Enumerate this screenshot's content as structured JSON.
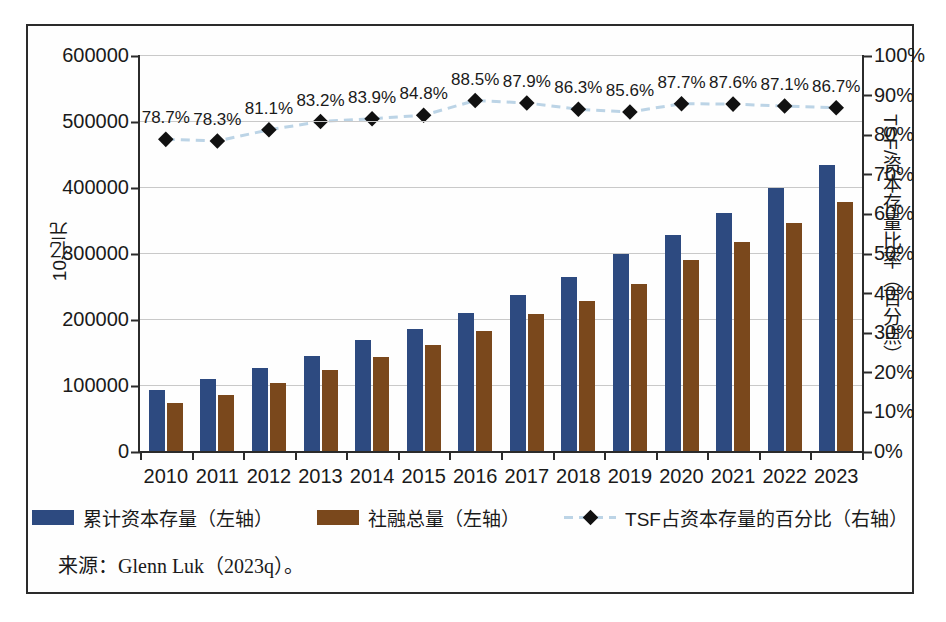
{
  "chart_data": {
    "type": "bar",
    "title": "",
    "subtitle": "",
    "xlabel": "",
    "ylabel": "10亿元",
    "ylabel_right": "TSF/资本存量比率（百分点）",
    "grid": true,
    "legend_position": "bottom",
    "ylim": [
      0,
      600000
    ],
    "ylim_right": [
      0,
      100
    ],
    "ytick_labels": [
      "600000",
      "500000",
      "400000",
      "300000",
      "200000",
      "100000",
      "0"
    ],
    "ytick_values": [
      600000,
      500000,
      400000,
      300000,
      200000,
      100000,
      0
    ],
    "ytick_right_labels": [
      "100%",
      "90%",
      "80%",
      "70%",
      "60%",
      "50%",
      "40%",
      "30%",
      "20%",
      "10%",
      "0%"
    ],
    "ytick_right_values": [
      100,
      90,
      80,
      70,
      60,
      50,
      40,
      30,
      20,
      10,
      0
    ],
    "categories": [
      "2010",
      "2011",
      "2012",
      "2013",
      "2014",
      "2015",
      "2016",
      "2017",
      "2018",
      "2019",
      "2020",
      "2021",
      "2022",
      "2023"
    ],
    "series": [
      {
        "name": "累计资本存量（左轴）",
        "type": "bar",
        "axis": "left",
        "color": "#2d4a80",
        "values": [
          92000,
          109000,
          126000,
          144000,
          168000,
          185000,
          209000,
          236000,
          264000,
          298000,
          327000,
          360000,
          398000,
          434000
        ]
      },
      {
        "name": "社融总量（左轴）",
        "type": "bar",
        "axis": "left",
        "color": "#7a481c",
        "values": [
          72000,
          85000,
          103000,
          122000,
          142000,
          160000,
          182000,
          207000,
          228000,
          253000,
          289000,
          317000,
          346000,
          377000
        ]
      },
      {
        "name": "TSF占资本存量的百分比（右轴）",
        "type": "line",
        "axis": "right",
        "color": "#bcd4e6",
        "marker": "diamond",
        "marker_color": "#111111",
        "values": [
          78.7,
          78.3,
          81.1,
          83.2,
          83.9,
          84.8,
          88.5,
          87.9,
          86.3,
          85.6,
          87.7,
          87.6,
          87.1,
          86.7
        ],
        "data_labels": [
          "78.7%",
          "78.3%",
          "81.1%",
          "83.2%",
          "83.9%",
          "84.8%",
          "88.5%",
          "87.9%",
          "86.3%",
          "85.6%",
          "87.7%",
          "87.6%",
          "87.1%",
          "86.7%"
        ]
      }
    ],
    "annotations": []
  },
  "legend": {
    "items": [
      {
        "label": "累计资本存量（左轴）",
        "marker": "square",
        "color": "#2d4a80"
      },
      {
        "label": "社融总量（左轴）",
        "marker": "square",
        "color": "#7a481c"
      },
      {
        "label": "TSF占资本存量的百分比（右轴）",
        "marker": "dashed-line-diamond",
        "color": "#bcd4e6"
      }
    ]
  },
  "source": {
    "text": "来源：Glenn Luk（2023q）。"
  }
}
